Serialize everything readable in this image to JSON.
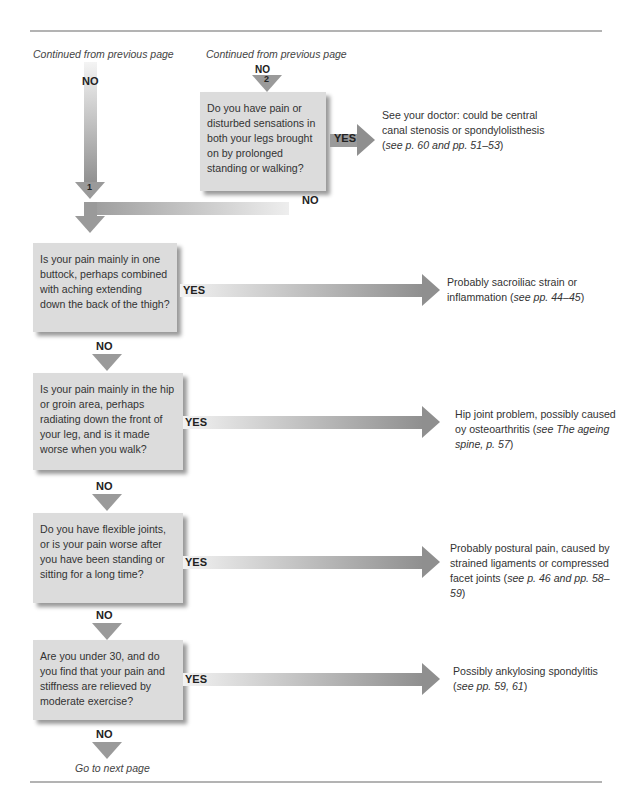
{
  "header": {
    "continued_left": "Continued from previous page",
    "continued_right": "Continued from previous page"
  },
  "flow": {
    "no_label": "NO",
    "yes_label": "YES",
    "marker_1": "1",
    "marker_2": "2",
    "questions": [
      "Do you have pain or disturbed sensations in both your legs brought on by prolonged standing or walking?",
      "Is your pain mainly in one buttock, perhaps combined with aching extending down the back of the thigh?",
      "Is your pain mainly in the hip or groin area, perhaps radiating down the front of your leg, and is it made worse when you walk?",
      "Do you have flexible joints, or is your pain worse after you have been standing or sitting for a long time?",
      "Are you under 30, and do you find that your pain and stiffness are relieved by moderate exercise?"
    ],
    "results": [
      {
        "text": "See your doctor: could be central canal stenosis or spondylolisthesis (",
        "ref": "see p. 60 and pp. 51–53",
        "end": ")"
      },
      {
        "text": "Probably sacroiliac strain or inflammation (",
        "ref": "see pp. 44–45",
        "end": ")"
      },
      {
        "text": "Hip joint problem, possibly caused oy osteoarthritis (",
        "ref": "see The ageing spine, p. 57",
        "end": ")"
      },
      {
        "text": "Probably postural pain, caused by strained ligaments or compressed facet joints (",
        "ref": "see p. 46 and pp. 58–59",
        "end": ")"
      },
      {
        "text": "Possibly ankylosing spondylitis (",
        "ref": "see pp. 59, 61",
        "end": ")"
      }
    ]
  },
  "footer": {
    "next": "Go to next page"
  }
}
